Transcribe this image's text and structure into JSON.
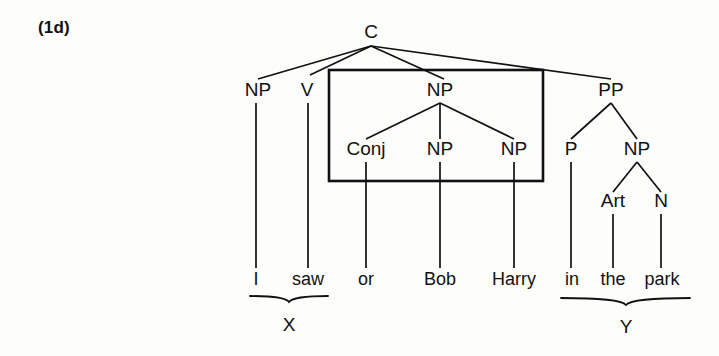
{
  "figure": {
    "example_label": "(1d)",
    "caption_x": "X",
    "caption_y": "Y"
  },
  "tree": {
    "root": {
      "label": "C",
      "x": 371,
      "y": 38
    },
    "nodes": [
      {
        "id": "np-subj",
        "label": "NP",
        "x": 258,
        "y": 96
      },
      {
        "id": "v",
        "label": "V",
        "x": 307,
        "y": 96
      },
      {
        "id": "np-coord",
        "label": "NP",
        "x": 440,
        "y": 96
      },
      {
        "id": "pp",
        "label": "PP",
        "x": 611,
        "y": 96
      },
      {
        "id": "conj",
        "label": "Conj",
        "x": 366,
        "y": 155
      },
      {
        "id": "np-bob",
        "label": "NP",
        "x": 440,
        "y": 155
      },
      {
        "id": "np-harry",
        "label": "NP",
        "x": 514,
        "y": 155
      },
      {
        "id": "p",
        "label": "P",
        "x": 571,
        "y": 155
      },
      {
        "id": "np-obj",
        "label": "NP",
        "x": 637,
        "y": 155
      },
      {
        "id": "art",
        "label": "Art",
        "x": 613,
        "y": 207
      },
      {
        "id": "n",
        "label": "N",
        "x": 661,
        "y": 207
      }
    ],
    "words": [
      {
        "id": "w-i",
        "text": "I",
        "x": 256,
        "y": 285
      },
      {
        "id": "w-saw",
        "text": "saw",
        "x": 308,
        "y": 285
      },
      {
        "id": "w-or",
        "text": "or",
        "x": 366,
        "y": 285
      },
      {
        "id": "w-bob",
        "text": "Bob",
        "x": 440,
        "y": 285
      },
      {
        "id": "w-harry",
        "text": "Harry",
        "x": 514,
        "y": 285
      },
      {
        "id": "w-in",
        "text": "in",
        "x": 572,
        "y": 285
      },
      {
        "id": "w-the",
        "text": "the",
        "x": 613,
        "y": 285
      },
      {
        "id": "w-park",
        "text": "park",
        "x": 662,
        "y": 285
      }
    ],
    "box": {
      "x": 329,
      "y": 70,
      "width": 214,
      "height": 111
    },
    "braces": [
      {
        "id": "brace-x",
        "label": "X",
        "x1": 250,
        "x2": 328,
        "y": 297,
        "label_x": 289,
        "label_y": 331
      },
      {
        "id": "brace-y",
        "label": "Y",
        "x1": 561,
        "x2": 690,
        "y": 299,
        "label_x": 626,
        "label_y": 333
      }
    ]
  }
}
